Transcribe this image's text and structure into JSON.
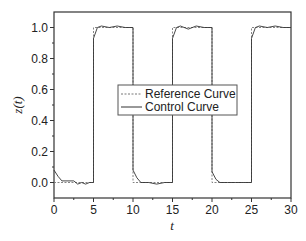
{
  "chart_data": {
    "type": "line",
    "title": "",
    "xlabel": "t",
    "ylabel": "z(t)",
    "xlim": [
      0,
      30
    ],
    "ylim": [
      -0.1,
      1.1
    ],
    "xticks": [
      0,
      5,
      10,
      15,
      20,
      25,
      30
    ],
    "xtick_labels": [
      "0",
      "5",
      "10",
      "15",
      "20",
      "25",
      "30"
    ],
    "yticks": [
      0.0,
      0.2,
      0.4,
      0.6,
      0.8,
      1.0
    ],
    "ytick_labels": [
      "0.0",
      "0.2",
      "0.4",
      "0.6",
      "0.8",
      "1.0"
    ],
    "grid": false,
    "legend_position": "center-right",
    "legend": [
      "Reference Curve",
      "Control Curve"
    ],
    "series": [
      {
        "name": "Reference Curve",
        "style": "dashed",
        "x": [
          0,
          5,
          5,
          10,
          10,
          15,
          15,
          20,
          20,
          25,
          25,
          30
        ],
        "y": [
          0,
          0,
          1,
          1,
          0,
          0,
          1,
          1,
          0,
          0,
          1,
          1
        ]
      },
      {
        "name": "Control Curve",
        "style": "solid",
        "x": [
          0,
          0.5,
          1,
          2.5,
          3,
          3.5,
          4,
          4.5,
          5,
          5,
          5.5,
          6,
          7,
          8,
          9,
          10,
          10,
          10.5,
          11,
          12,
          13,
          14,
          15,
          15,
          15.5,
          16,
          17,
          18,
          19,
          20,
          20,
          20.5,
          21,
          22,
          23,
          24,
          25,
          25,
          25.5,
          26,
          27,
          28,
          29,
          30
        ],
        "y": [
          0.08,
          0.04,
          0.01,
          0.01,
          -0.01,
          0.0,
          -0.01,
          0.0,
          0.0,
          0.93,
          1.0,
          1.01,
          1.0,
          1.01,
          1.0,
          1.0,
          0.08,
          0.03,
          0.0,
          0.0,
          -0.01,
          0.0,
          0.0,
          0.93,
          1.0,
          1.01,
          0.99,
          1.01,
          1.0,
          1.0,
          0.07,
          0.02,
          0.0,
          0.0,
          0.0,
          0.0,
          0.0,
          0.93,
          1.0,
          1.01,
          1.0,
          1.01,
          1.0,
          1.0
        ]
      }
    ]
  },
  "figure": {
    "cut_off_caption": "the  ...  ...  (cut off)"
  }
}
